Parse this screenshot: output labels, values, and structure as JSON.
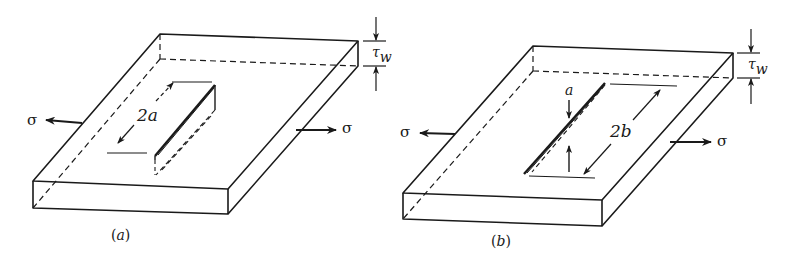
{
  "figure": {
    "panels": [
      {
        "id": "a",
        "caption": "(a)",
        "crack_dimension_label": "2a",
        "stress_label_left": "σ",
        "stress_label_right": "σ",
        "thickness_label_main": "τ",
        "thickness_label_sub": "w",
        "description": "Plate with through-thickness crack of length 2a under remote tension σ"
      },
      {
        "id": "b",
        "caption": "(b)",
        "crack_depth_label": "a",
        "crack_dimension_label": "2b",
        "stress_label_left": "σ",
        "stress_label_right": "σ",
        "thickness_label_main": "τ",
        "thickness_label_sub": "w",
        "description": "Plate with surface crack of depth a and length 2b under remote tension σ"
      }
    ],
    "line_color": "#1a1a1a",
    "background": "#ffffff"
  }
}
